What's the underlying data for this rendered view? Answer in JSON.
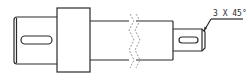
{
  "diagram": {
    "type": "shaft-drawing",
    "annotation": {
      "chamfer_label": "3 X 45°"
    },
    "parts": [
      {
        "name": "left-shaft-end",
        "has_keyway": true
      },
      {
        "name": "collar"
      },
      {
        "name": "main-shaft",
        "has_break": true
      },
      {
        "name": "right-shaft-end",
        "has_keyway": true,
        "has_chamfer": true
      }
    ],
    "colors": {
      "line": "#2b2b2b",
      "break_line": "#9a9a9a",
      "background": "#ffffff"
    }
  }
}
